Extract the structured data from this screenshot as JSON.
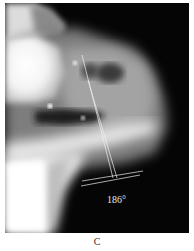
{
  "figure": {
    "panel_label": "C",
    "image_type": "lateral radiograph",
    "annotation": {
      "angle_label": "186°",
      "line_color": "#f0f0f0"
    },
    "colors": {
      "background": "#050505",
      "bone_highlight": "#ffffff",
      "soft_tissue": "#9a9a9a"
    }
  }
}
